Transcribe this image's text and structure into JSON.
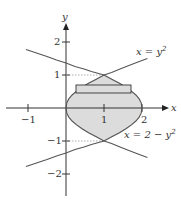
{
  "figure": {
    "axes": {
      "x_label": "x",
      "y_label": "y",
      "x_ticks": [
        "−1",
        "1",
        "2"
      ],
      "y_ticks": [
        "2",
        "1",
        "−1",
        "−2"
      ],
      "x_range": [
        -1.6,
        2.3
      ],
      "y_range": [
        -2.7,
        2.6
      ]
    },
    "curves": [
      {
        "name": "left-parabola",
        "equation_label_lhs": "x = ",
        "equation_label_rhs": "y",
        "equation_label_sup": "2"
      },
      {
        "name": "right-parabola",
        "equation_label_lhs": "x = 2 − ",
        "equation_label_rhs": "y",
        "equation_label_sup": "2"
      }
    ],
    "intersections": [
      [
        1,
        1
      ],
      [
        1,
        -1
      ]
    ],
    "shaded_region": {
      "fill": "#dcdcdc",
      "between": "x = y^2 and x = 2 - y^2, -1 ≤ y ≤ 1"
    },
    "rectangle": {
      "y_bottom": 0.45,
      "y_top": 0.7,
      "orientation": "horizontal"
    },
    "colors": {
      "curve": "#555555",
      "axis": "#333333",
      "fill": "#dcdcdc",
      "guide": "#999999"
    }
  }
}
